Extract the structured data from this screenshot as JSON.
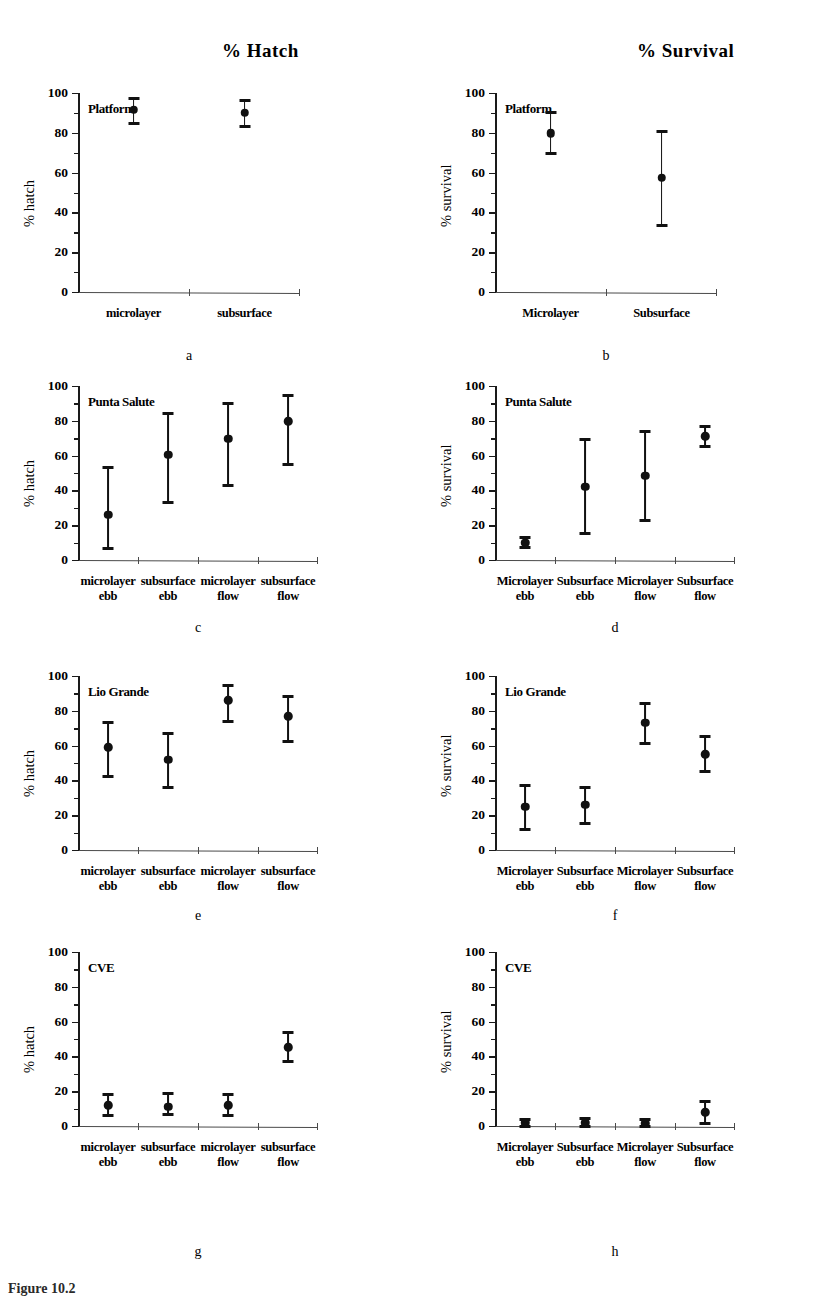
{
  "figure": {
    "column_titles": [
      "% Hatch",
      "% Survival"
    ],
    "caption": "Figure 10.2",
    "axis_titles": {
      "hatch": "% hatch",
      "survival": "% survival"
    },
    "y_ticks": [
      0,
      20,
      40,
      60,
      80,
      100
    ],
    "ylim": [
      0,
      100
    ]
  },
  "chart_data": [
    {
      "type": "scatter",
      "panel": "a",
      "title": "% Hatch",
      "site": "Platform",
      "xlabel": "",
      "ylabel": "% hatch",
      "ylim": [
        0,
        100
      ],
      "grid": false,
      "legend": "none",
      "categories": [
        "microlayer",
        "subsurface"
      ],
      "values": [
        91.5,
        90.0
      ],
      "err_low": [
        84.5,
        83.0
      ],
      "err_high": [
        97.0,
        96.0
      ]
    },
    {
      "type": "scatter",
      "panel": "b",
      "title": "% Survival",
      "site": "Platform",
      "xlabel": "",
      "ylabel": "% survival",
      "ylim": [
        0,
        100
      ],
      "grid": false,
      "legend": "none",
      "categories": [
        "Microlayer",
        "Subsurface"
      ],
      "values": [
        79.8,
        57.5
      ],
      "err_low": [
        69.5,
        33.5
      ],
      "err_high": [
        90.0,
        80.5
      ]
    },
    {
      "type": "scatter",
      "panel": "c",
      "title": "% Hatch",
      "site": "Punta Salute",
      "xlabel": "",
      "ylabel": "% hatch",
      "ylim": [
        0,
        100
      ],
      "grid": false,
      "legend": "none",
      "categories": [
        "microlayer ebb",
        "subsurface ebb",
        "microlayer flow",
        "subsurface flow"
      ],
      "category_lines": [
        [
          "microlayer",
          "ebb"
        ],
        [
          "subsurface",
          "ebb"
        ],
        [
          "microlayer",
          "flow"
        ],
        [
          "subsurface",
          "flow"
        ]
      ],
      "values": [
        26.0,
        60.5,
        69.8,
        79.8
      ],
      "err_low": [
        6.8,
        32.8,
        43.0,
        55.0
      ],
      "err_high": [
        53.0,
        84.0,
        90.0,
        94.5
      ]
    },
    {
      "type": "scatter",
      "panel": "d",
      "title": "% Survival",
      "site": "Punta Salute",
      "xlabel": "",
      "ylabel": "% survival",
      "ylim": [
        0,
        100
      ],
      "grid": false,
      "legend": "none",
      "categories": [
        "Microlayer ebb",
        "Subsurface ebb",
        "Microlayer flow",
        "Subsurface flow"
      ],
      "category_lines": [
        [
          "Microlayer",
          "ebb"
        ],
        [
          "Subsurface",
          "ebb"
        ],
        [
          "Microlayer",
          "flow"
        ],
        [
          "Subsurface",
          "flow"
        ]
      ],
      "values": [
        9.8,
        42.0,
        48.5,
        71.0
      ],
      "err_low": [
        7.0,
        15.0,
        22.5,
        65.0
      ],
      "err_high": [
        13.0,
        69.0,
        74.0,
        77.0
      ]
    },
    {
      "type": "scatter",
      "panel": "e",
      "title": "% Hatch",
      "site": "Lio Grande",
      "xlabel": "",
      "ylabel": "% hatch",
      "ylim": [
        0,
        100
      ],
      "grid": false,
      "legend": "none",
      "categories": [
        "microlayer ebb",
        "subsurface ebb",
        "microlayer flow",
        "subsurface flow"
      ],
      "category_lines": [
        [
          "microlayer",
          "ebb"
        ],
        [
          "subsurface",
          "ebb"
        ],
        [
          "microlayer",
          "flow"
        ],
        [
          "subsurface",
          "flow"
        ]
      ],
      "values": [
        59.0,
        52.0,
        86.0,
        77.0
      ],
      "err_low": [
        42.5,
        36.0,
        74.0,
        62.5
      ],
      "err_high": [
        73.5,
        67.0,
        94.5,
        88.0
      ]
    },
    {
      "type": "scatter",
      "panel": "f",
      "title": "% Survival",
      "site": "Lio Grande",
      "xlabel": "",
      "ylabel": "% survival",
      "ylim": [
        0,
        100
      ],
      "grid": false,
      "legend": "none",
      "categories": [
        "Microlayer ebb",
        "Subsurface ebb",
        "Microlayer flow",
        "Subsurface flow"
      ],
      "category_lines": [
        [
          "Microlayer",
          "ebb"
        ],
        [
          "Subsurface",
          "ebb"
        ],
        [
          "Microlayer",
          "flow"
        ],
        [
          "Subsurface",
          "flow"
        ]
      ],
      "values": [
        25.0,
        26.0,
        73.0,
        55.0
      ],
      "err_low": [
        12.0,
        15.5,
        61.0,
        45.0
      ],
      "err_high": [
        37.0,
        36.0,
        84.0,
        65.0
      ]
    },
    {
      "type": "scatter",
      "panel": "g",
      "title": "% Hatch",
      "site": "CVE",
      "xlabel": "",
      "ylabel": "% hatch",
      "ylim": [
        0,
        100
      ],
      "grid": false,
      "legend": "none",
      "categories": [
        "microlayer ebb",
        "subsurface ebb",
        "microlayer flow",
        "subsurface flow"
      ],
      "category_lines": [
        [
          "microlayer",
          "ebb"
        ],
        [
          "subsurface",
          "ebb"
        ],
        [
          "microlayer",
          "flow"
        ],
        [
          "subsurface",
          "flow"
        ]
      ],
      "values": [
        11.8,
        11.0,
        12.0,
        45.2
      ],
      "err_low": [
        6.0,
        6.5,
        6.0,
        37.0
      ],
      "err_high": [
        18.0,
        18.5,
        18.0,
        53.5
      ]
    },
    {
      "type": "scatter",
      "panel": "h",
      "title": "% Survival",
      "site": "CVE",
      "xlabel": "",
      "ylabel": "% survival",
      "ylim": [
        0,
        100
      ],
      "grid": false,
      "legend": "none",
      "categories": [
        "Microlayer ebb",
        "Subsurface ebb",
        "Microlayer flow",
        "Subsurface flow"
      ],
      "category_lines": [
        [
          "Microlayer",
          "ebb"
        ],
        [
          "Subsurface",
          "ebb"
        ],
        [
          "Microlayer",
          "flow"
        ],
        [
          "Subsurface",
          "flow"
        ]
      ],
      "values": [
        2.0,
        2.0,
        1.5,
        8.0
      ],
      "err_low": [
        0.0,
        0.0,
        0.0,
        1.5
      ],
      "err_high": [
        4.0,
        4.5,
        3.5,
        14.0
      ]
    }
  ]
}
